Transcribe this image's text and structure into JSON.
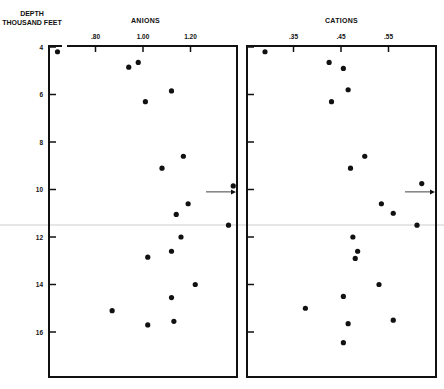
{
  "chart_data": [
    {
      "type": "scatter",
      "title": "ANIONS",
      "ylabel": "DEPTH THOUSAND FEET",
      "xlabel": "",
      "xticks": [
        0.8,
        1.0,
        1.2
      ],
      "xtick_labels": [
        ".80",
        "1.00",
        "1.20"
      ],
      "yticks": [
        4,
        6,
        8,
        10,
        12,
        14,
        16
      ],
      "xlim": [
        0.61,
        1.4
      ],
      "ylim": [
        17.8,
        4.0
      ],
      "y_inverted": true,
      "grid": false,
      "annotations": [
        {
          "type": "arrow",
          "depth": 10.1,
          "pointing": "right",
          "at_edge": true
        }
      ],
      "points": [
        {
          "x": 0.64,
          "depth": 4.2
        },
        {
          "x": 0.98,
          "depth": 4.65
        },
        {
          "x": 0.94,
          "depth": 4.85
        },
        {
          "x": 1.12,
          "depth": 5.85
        },
        {
          "x": 1.01,
          "depth": 6.3
        },
        {
          "x": 1.17,
          "depth": 8.6
        },
        {
          "x": 1.08,
          "depth": 9.1
        },
        {
          "x": 1.38,
          "depth": 9.85
        },
        {
          "x": 1.19,
          "depth": 10.6
        },
        {
          "x": 1.14,
          "depth": 11.05
        },
        {
          "x": 1.36,
          "depth": 11.5
        },
        {
          "x": 1.16,
          "depth": 12.0
        },
        {
          "x": 1.12,
          "depth": 12.6
        },
        {
          "x": 1.02,
          "depth": 12.85
        },
        {
          "x": 1.22,
          "depth": 14.0
        },
        {
          "x": 1.12,
          "depth": 14.55
        },
        {
          "x": 0.87,
          "depth": 15.1
        },
        {
          "x": 1.13,
          "depth": 15.55
        },
        {
          "x": 1.02,
          "depth": 15.7
        }
      ]
    },
    {
      "type": "scatter",
      "title": "CATIONS",
      "ylabel": "DEPTH THOUSAND FEET",
      "xlabel": "",
      "xticks": [
        0.35,
        0.45,
        0.55
      ],
      "xtick_labels": [
        ".35",
        ".45",
        ".55"
      ],
      "yticks": [
        4,
        6,
        8,
        10,
        12,
        14,
        16
      ],
      "xlim": [
        0.258,
        0.656
      ],
      "ylim": [
        17.8,
        4.0
      ],
      "y_inverted": true,
      "grid": false,
      "annotations": [
        {
          "type": "arrow",
          "depth": 10.1,
          "pointing": "right",
          "at_edge": true
        }
      ],
      "points": [
        {
          "x": 0.29,
          "depth": 4.2
        },
        {
          "x": 0.425,
          "depth": 4.65
        },
        {
          "x": 0.455,
          "depth": 4.9
        },
        {
          "x": 0.465,
          "depth": 5.8
        },
        {
          "x": 0.43,
          "depth": 6.3
        },
        {
          "x": 0.5,
          "depth": 8.6
        },
        {
          "x": 0.47,
          "depth": 9.1
        },
        {
          "x": 0.62,
          "depth": 9.75
        },
        {
          "x": 0.535,
          "depth": 10.6
        },
        {
          "x": 0.56,
          "depth": 11.0
        },
        {
          "x": 0.61,
          "depth": 11.5
        },
        {
          "x": 0.475,
          "depth": 12.0
        },
        {
          "x": 0.485,
          "depth": 12.6
        },
        {
          "x": 0.48,
          "depth": 12.9
        },
        {
          "x": 0.53,
          "depth": 14.0
        },
        {
          "x": 0.455,
          "depth": 14.5
        },
        {
          "x": 0.375,
          "depth": 15.0
        },
        {
          "x": 0.56,
          "depth": 15.5
        },
        {
          "x": 0.465,
          "depth": 15.65
        },
        {
          "x": 0.455,
          "depth": 16.45
        }
      ]
    }
  ],
  "labels": {
    "y_axis_line1": "DEPTH",
    "y_axis_line2": "THOUSAND FEET",
    "anions_title": "ANIONS",
    "cations_title": "CATIONS",
    "y_tick_labels": [
      "4",
      "6",
      "8",
      "10",
      "12",
      "14",
      "16"
    ]
  },
  "colors": {
    "ink": "#111111",
    "background": "#ffffff"
  }
}
